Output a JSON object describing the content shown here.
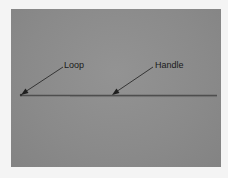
{
  "figure": {
    "background_color": "#8a8a8a",
    "labels": [
      {
        "id": "loop",
        "text": "Loop"
      },
      {
        "id": "handle",
        "text": "Handle"
      }
    ]
  }
}
